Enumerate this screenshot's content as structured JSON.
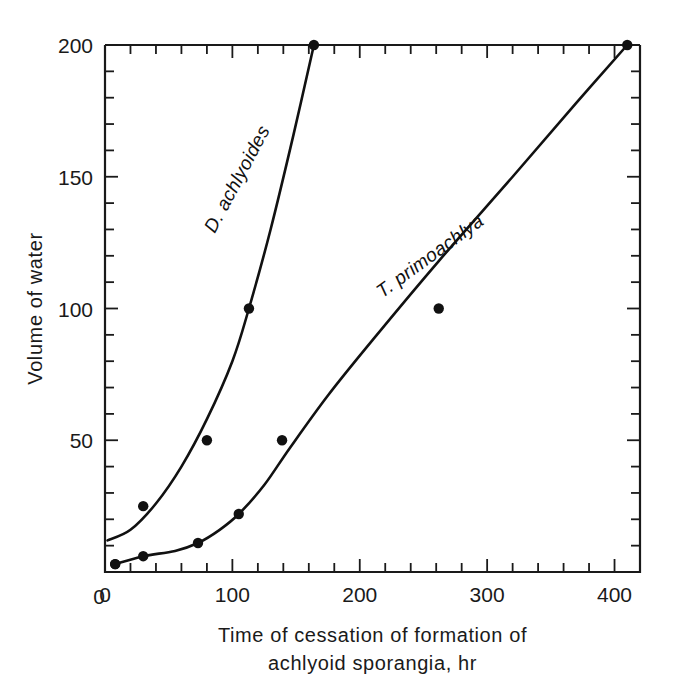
{
  "chart_data": {
    "type": "scatter",
    "title": "",
    "xlabel": "Time of cessation of formation of achlyoid sporangia, hr",
    "xlabel_line1": "Time of cessation of formation of",
    "xlabel_line2": "achlyoid sporangia, hr",
    "ylabel": "Volume of water",
    "xlim": [
      0,
      420
    ],
    "ylim": [
      0,
      200
    ],
    "xticks": [
      0,
      100,
      200,
      300,
      400
    ],
    "xticklabels": [
      "0",
      "100",
      "200",
      "300",
      "400"
    ],
    "yticks": [
      0,
      50,
      100,
      150,
      200
    ],
    "yticklabels": [
      "0",
      "50",
      "100",
      "150",
      "200"
    ],
    "x_minor_step": 20,
    "y_minor_step": 10,
    "grid": false,
    "legend_position": "inline-curve-labels",
    "marker": "filled-circle",
    "marker_color": "#111111",
    "line_color": "#111111",
    "series": [
      {
        "name": "D. achlyoides",
        "label": "D. achlyoides",
        "label_rotation": -62,
        "label_x": 108,
        "label_y": 148,
        "points": [
          {
            "x": 8,
            "y": 3
          },
          {
            "x": 30,
            "y": 25
          },
          {
            "x": 80,
            "y": 50
          },
          {
            "x": 113,
            "y": 100
          },
          {
            "x": 164,
            "y": 200
          }
        ],
        "curve": [
          {
            "x": 2,
            "y": 12
          },
          {
            "x": 20,
            "y": 16
          },
          {
            "x": 40,
            "y": 26
          },
          {
            "x": 60,
            "y": 40
          },
          {
            "x": 80,
            "y": 58
          },
          {
            "x": 100,
            "y": 80
          },
          {
            "x": 113,
            "y": 100
          },
          {
            "x": 130,
            "y": 130
          },
          {
            "x": 148,
            "y": 166
          },
          {
            "x": 164,
            "y": 200
          }
        ]
      },
      {
        "name": "T. primoachlya",
        "label": "T. primoachlya",
        "label_rotation": -36,
        "label_x": 258,
        "label_y": 118,
        "points": [
          {
            "x": 8,
            "y": 3
          },
          {
            "x": 30,
            "y": 6
          },
          {
            "x": 73,
            "y": 11
          },
          {
            "x": 105,
            "y": 22
          },
          {
            "x": 139,
            "y": 50
          },
          {
            "x": 262,
            "y": 100
          },
          {
            "x": 410,
            "y": 200
          }
        ],
        "curve": [
          {
            "x": 8,
            "y": 3
          },
          {
            "x": 30,
            "y": 6
          },
          {
            "x": 55,
            "y": 8
          },
          {
            "x": 73,
            "y": 11
          },
          {
            "x": 90,
            "y": 16
          },
          {
            "x": 105,
            "y": 22
          },
          {
            "x": 125,
            "y": 33
          },
          {
            "x": 145,
            "y": 47
          },
          {
            "x": 175,
            "y": 67
          },
          {
            "x": 210,
            "y": 88
          },
          {
            "x": 262,
            "y": 118
          },
          {
            "x": 320,
            "y": 150
          },
          {
            "x": 370,
            "y": 178
          },
          {
            "x": 410,
            "y": 200
          }
        ]
      }
    ]
  }
}
